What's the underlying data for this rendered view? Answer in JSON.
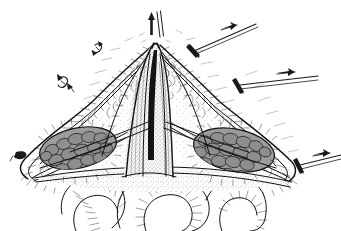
{
  "figure": {
    "type": "medical-illustration",
    "style": "pen-and-ink line drawing",
    "background_color": "#ffffff",
    "ink_color": "#1a1a1a",
    "canvas": {
      "width": 341,
      "height": 231
    }
  },
  "anatomy": {
    "midline_incision": {
      "name": "midline-incision",
      "description": "Central vertical tented fascial / linea alba structure drawn with dense stipple"
    },
    "left_flap": {
      "name": "left-tissue-flap",
      "description": "Retracted left fascio-cutaneous flap with hatched dermal edge"
    },
    "right_flap": {
      "name": "right-tissue-flap",
      "description": "Retracted right fascio-cutaneous flap with hatched dermal edge"
    },
    "left_muscle_belly": {
      "name": "left-muscle-belly",
      "description": "Cobblestone fascicular muscle cross-section, left side"
    },
    "right_muscle_belly": {
      "name": "right-muscle-belly",
      "description": "Cobblestone fascicular muscle cross-section, right side"
    },
    "viscera": {
      "name": "bowel-loops",
      "description": "Three smooth tubular bowel loops with fine hatch shading at the base"
    }
  },
  "instruments": [
    {
      "id": "traction-suture-top",
      "label": "upward traction suture",
      "position": "top-center",
      "direction": "up"
    },
    {
      "id": "retractor-upper-right",
      "label": "retractor with traction arrow",
      "position": "upper-right",
      "direction": "up-right"
    },
    {
      "id": "retractor-mid-right",
      "label": "retractor with traction arrow",
      "position": "mid-right",
      "direction": "right"
    },
    {
      "id": "retractor-lower-right",
      "label": "retractor with traction arrow",
      "position": "lower-right",
      "direction": "right"
    },
    {
      "id": "hook-upper-left",
      "label": "small skin hook",
      "position": "upper-left"
    },
    {
      "id": "hook-mid-left",
      "label": "small skin hook",
      "position": "mid-left"
    },
    {
      "id": "hook-lower-left",
      "label": "small skin hook",
      "position": "lower-left"
    }
  ],
  "labels": {
    "visible_text": []
  }
}
